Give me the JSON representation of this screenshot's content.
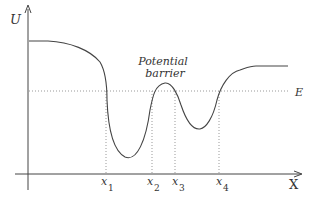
{
  "diagram": {
    "y_axis_label": "U",
    "x_axis_label": "X",
    "energy_level_label": "E",
    "annotation": {
      "line1": "Potential",
      "line2": "barrier"
    },
    "turning_points": [
      {
        "label": "x",
        "sub": "1"
      },
      {
        "label": "x",
        "sub": "2"
      },
      {
        "label": "x",
        "sub": "3"
      },
      {
        "label": "x",
        "sub": "4"
      }
    ],
    "colors": {
      "curve": "#444444",
      "axes": "#444444",
      "dotted": "#999999",
      "text": "#333333"
    }
  }
}
